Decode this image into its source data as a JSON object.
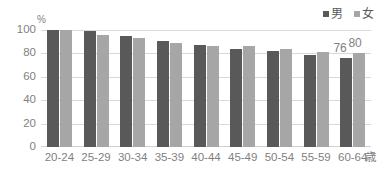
{
  "chart_data": {
    "type": "bar",
    "title": "",
    "subtitle": "",
    "xlabel": "歳",
    "ylabel": "%",
    "ylim": [
      0,
      100
    ],
    "yticks": [
      0,
      20,
      40,
      60,
      80,
      100
    ],
    "grid": true,
    "legend_position": "top-right",
    "categories": [
      "20-24",
      "25-29",
      "30-34",
      "35-39",
      "40-44",
      "45-49",
      "50-54",
      "55-59",
      "60-64"
    ],
    "series": [
      {
        "name": "男",
        "color": "#595959",
        "values": [
          100,
          99,
          95,
          91,
          87,
          84,
          82,
          79,
          76
        ]
      },
      {
        "name": "女",
        "color": "#a6a6a6",
        "values": [
          100,
          96,
          93,
          89,
          86,
          86,
          84,
          81,
          80
        ]
      }
    ],
    "annotations": [
      {
        "text": "76",
        "series": "男",
        "category": "60-64",
        "value": 76
      },
      {
        "text": "80",
        "series": "女",
        "category": "60-64",
        "value": 80
      }
    ]
  },
  "axis": {
    "y_unit": "%",
    "y_ticks": [
      "100",
      "80",
      "60",
      "40",
      "20",
      "0"
    ],
    "x_unit": "歳",
    "x_ticks": [
      "20-24",
      "25-29",
      "30-34",
      "35-39",
      "40-44",
      "45-49",
      "50-54",
      "55-59",
      "60-64"
    ]
  },
  "legend": {
    "items": [
      {
        "label": "男",
        "color": "#595959"
      },
      {
        "label": "女",
        "color": "#a6a6a6"
      }
    ]
  },
  "colors": {
    "male": "#595959",
    "female": "#a6a6a6",
    "grid": "#d9d9d9",
    "text": "#7f7f7f",
    "background": "#ffffff"
  }
}
